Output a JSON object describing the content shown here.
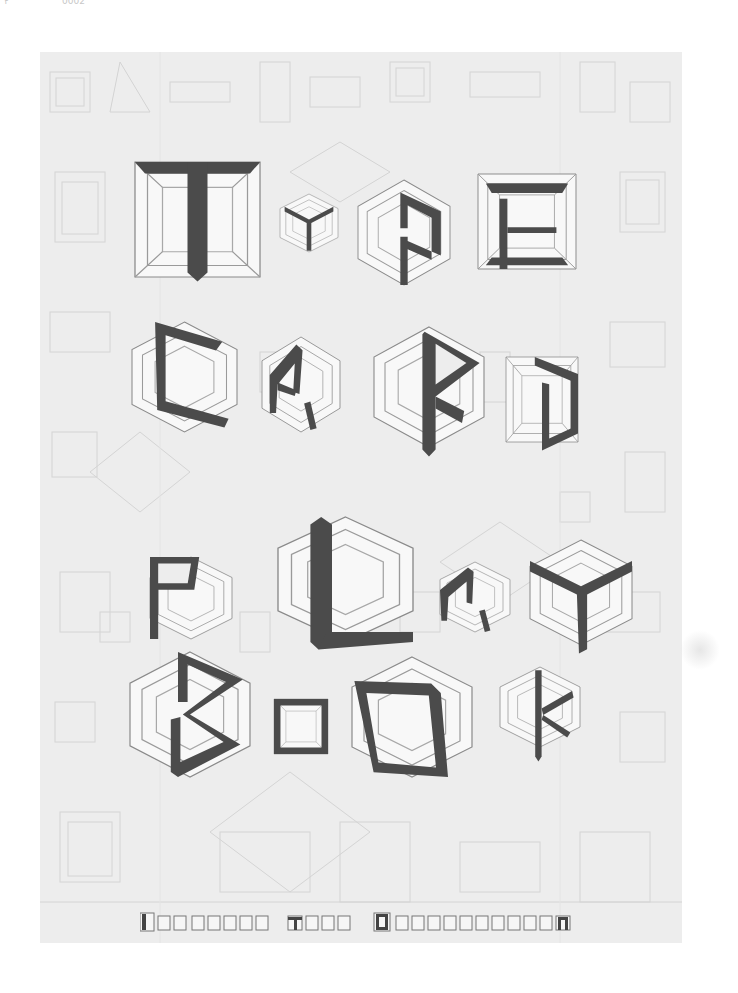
{
  "scan_header": {
    "left_text": "۲",
    "right_text": "0002"
  },
  "cover": {
    "title_lines": [
      "Type",
      "Card",
      "Play",
      "Book"
    ],
    "title_full": "Type Card Play Book",
    "subtitle": "Dominion Type Organization",
    "colors": {
      "page_background": "#ededed",
      "outside_background": "#ffffff",
      "glyph_fill": "#4b4b4b",
      "cube_outline": "#8a8a8a",
      "cube_face": "#f7f7f7",
      "texture_line": "#d9d9d9"
    }
  }
}
